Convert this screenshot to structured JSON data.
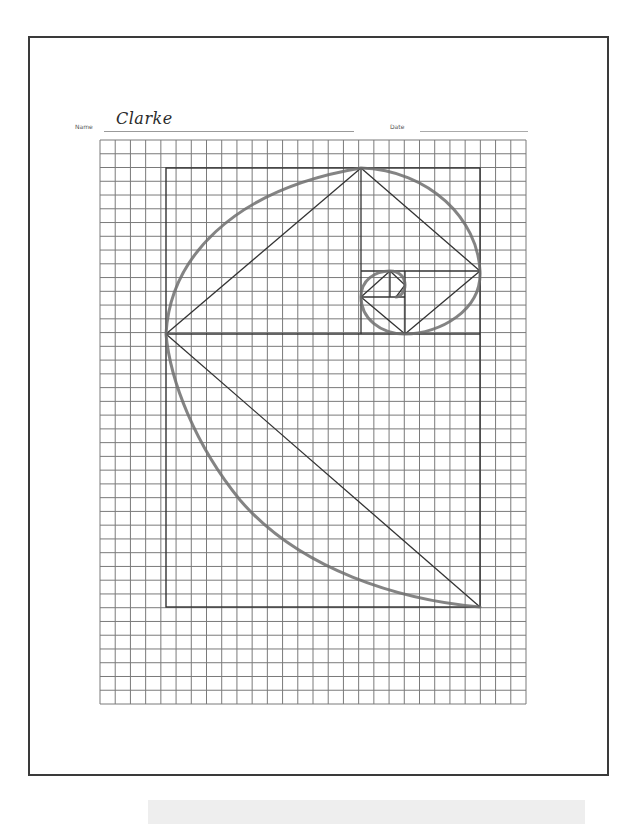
{
  "worksheet": {
    "name_label": "Name",
    "name_value": "Clarke",
    "date_label": "Date",
    "date_value": ""
  },
  "graph_paper": {
    "left": 100,
    "top": 140,
    "right": 526,
    "bottom": 704,
    "cols": 28,
    "rows": 41,
    "line_color": "#7a7a7a"
  },
  "construction": {
    "outer_rect": {
      "x1": 166,
      "y1": 168,
      "x2": 480,
      "y2": 607
    },
    "lines": [
      {
        "x1": 361,
        "y1": 168,
        "x2": 361,
        "y2": 334
      },
      {
        "x1": 166,
        "y1": 334,
        "x2": 480,
        "y2": 334
      },
      {
        "x1": 361,
        "y1": 271,
        "x2": 480,
        "y2": 271
      },
      {
        "x1": 405,
        "y1": 271,
        "x2": 405,
        "y2": 334
      },
      {
        "x1": 361,
        "y1": 297,
        "x2": 405,
        "y2": 297
      },
      {
        "x1": 390,
        "y1": 271,
        "x2": 390,
        "y2": 297
      },
      {
        "x1": 166,
        "y1": 334,
        "x2": 361,
        "y2": 168
      },
      {
        "x1": 361,
        "y1": 168,
        "x2": 480,
        "y2": 271
      },
      {
        "x1": 480,
        "y1": 271,
        "x2": 405,
        "y2": 334
      },
      {
        "x1": 405,
        "y1": 334,
        "x2": 361,
        "y2": 297
      },
      {
        "x1": 361,
        "y1": 297,
        "x2": 390,
        "y2": 271
      },
      {
        "x1": 390,
        "y1": 271,
        "x2": 405,
        "y2": 285
      },
      {
        "x1": 405,
        "y1": 285,
        "x2": 396,
        "y2": 297
      },
      {
        "x1": 166,
        "y1": 334,
        "x2": 480,
        "y2": 607
      }
    ],
    "spiral_path": "M480,607 C400,600 300,570 240,500 C195,445 170,380 166,334 C170,260 230,190 361,168 C430,170 478,220 480,271 C482,310 440,334 405,334 C380,334 361,318 361,297 C361,280 375,271 390,271 C400,271 405,278 405,285 C405,292 400,297 396,297",
    "line_color": "#333333",
    "spiral_color": "#6e6e6e"
  }
}
